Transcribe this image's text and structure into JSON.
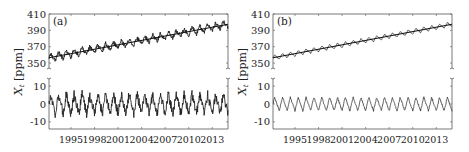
{
  "chart_data": [
    {
      "panel_label": "(a)",
      "type": "line",
      "ylabel": "X_t [ppm]",
      "x_ticks": [
        "1995",
        "1998",
        "2001",
        "2004",
        "2007",
        "2010",
        "2013"
      ],
      "xlim": [
        1992.2,
        2015.0
      ],
      "subplots": [
        {
          "name": "observed-with-trend",
          "yticks": [
            350,
            370,
            390,
            410
          ],
          "ylim": [
            344,
            410
          ],
          "series": [
            {
              "name": "observed",
              "trend_start": 356.5,
              "trend_end": 397.5,
              "seasonal_amp": 4.5,
              "noise": 2.6
            },
            {
              "name": "trend",
              "start": 356.5,
              "end": 397.5
            }
          ]
        },
        {
          "name": "detrended",
          "yticks": [
            -10,
            0,
            10
          ],
          "ylim": [
            -14,
            14
          ],
          "series": [
            {
              "name": "residual",
              "seasonal_amp": 5.5,
              "noise": 2.6
            }
          ]
        }
      ]
    },
    {
      "panel_label": "(b)",
      "type": "line",
      "ylabel": "X_t [ppm]",
      "x_ticks": [
        "1995",
        "1998",
        "2001",
        "2004",
        "2007",
        "2010",
        "2013"
      ],
      "xlim": [
        1992.2,
        2015.0
      ],
      "subplots": [
        {
          "name": "observed-with-trend",
          "yticks": [
            350,
            370,
            390,
            410
          ],
          "ylim": [
            344,
            410
          ],
          "series": [
            {
              "name": "observed",
              "trend_start": 356.5,
              "trend_end": 397.5,
              "seasonal_amp": 3.2,
              "noise": 0.5
            },
            {
              "name": "trend",
              "start": 356.5,
              "end": 397.5
            }
          ]
        },
        {
          "name": "detrended",
          "yticks": [
            -10,
            0,
            10
          ],
          "ylim": [
            -14,
            14
          ],
          "series": [
            {
              "name": "residual",
              "seasonal_amp": 3.8,
              "noise": 0.5
            }
          ]
        }
      ]
    }
  ]
}
